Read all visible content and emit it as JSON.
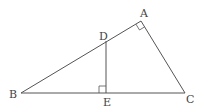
{
  "diagram": {
    "type": "geometry-triangle",
    "points": {
      "A": {
        "label": "A",
        "x": 141,
        "y": 21
      },
      "B": {
        "label": "B",
        "x": 21,
        "y": 93
      },
      "C": {
        "label": "C",
        "x": 185,
        "y": 93
      },
      "D": {
        "label": "D",
        "x": 106,
        "y": 41
      },
      "E": {
        "label": "E",
        "x": 106,
        "y": 93
      }
    },
    "segments": [
      "AB",
      "BC",
      "CA",
      "DE"
    ],
    "right_angles": [
      "BAC",
      "DEB"
    ],
    "line_color": "#555555",
    "label_color": "#444444"
  }
}
